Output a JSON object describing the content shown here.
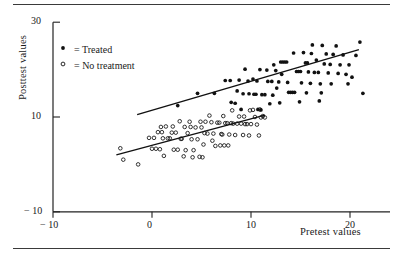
{
  "figure": {
    "rules": [
      "top-rule",
      "bottom-rule"
    ]
  },
  "chart_data": {
    "type": "scatter",
    "title": "",
    "xlabel": "Pretest values",
    "ylabel": "Posttest values",
    "xlim": [
      -14,
      24
    ],
    "ylim": [
      -10,
      32
    ],
    "xticks": [
      -10,
      0,
      10,
      20
    ],
    "xtick_labels": [
      "− 10",
      "0",
      "10",
      "20"
    ],
    "yticks": [
      -10,
      10,
      30
    ],
    "ytick_labels": [
      "− 10",
      "10",
      "30"
    ],
    "grid": false,
    "legend_position": "upper-left-inside",
    "legend": [
      {
        "marker": "filled-circle",
        "label": "= Treated"
      },
      {
        "marker": "open-circle",
        "label": "= No treatment"
      }
    ],
    "series": [
      {
        "name": "Treated",
        "marker": "filled-circle",
        "color": "#111111",
        "points": [
          [
            2.6,
            12.4
          ],
          [
            4.6,
            15.0
          ],
          [
            6.3,
            15.0
          ],
          [
            7.4,
            17.7
          ],
          [
            7.9,
            17.7
          ],
          [
            8.0,
            13.1
          ],
          [
            8.4,
            12.9
          ],
          [
            8.6,
            15.5
          ],
          [
            9.0,
            11.6
          ],
          [
            9.2,
            14.9
          ],
          [
            9.7,
            17.6
          ],
          [
            9.8,
            14.9
          ],
          [
            10.2,
            18.0
          ],
          [
            10.3,
            14.8
          ],
          [
            10.5,
            14.8
          ],
          [
            10.7,
            11.6
          ],
          [
            11.0,
            11.5
          ],
          [
            11.1,
            14.7
          ],
          [
            11.4,
            14.7
          ],
          [
            11.6,
            19.9
          ],
          [
            11.7,
            17.5
          ],
          [
            11.9,
            12.8
          ],
          [
            12.1,
            17.5
          ],
          [
            12.2,
            14.6
          ],
          [
            12.5,
            19.8
          ],
          [
            12.6,
            16.1
          ],
          [
            12.8,
            17.4
          ],
          [
            13.0,
            21.6
          ],
          [
            13.2,
            21.6
          ],
          [
            13.4,
            21.6
          ],
          [
            13.6,
            21.6
          ],
          [
            13.7,
            17.3
          ],
          [
            13.8,
            15.2
          ],
          [
            14.0,
            15.2
          ],
          [
            14.2,
            15.2
          ],
          [
            14.4,
            15.2
          ],
          [
            14.6,
            19.6
          ],
          [
            14.8,
            19.6
          ],
          [
            15.0,
            19.6
          ],
          [
            15.1,
            17.2
          ],
          [
            15.3,
            23.6
          ],
          [
            15.5,
            21.4
          ],
          [
            15.7,
            21.4
          ],
          [
            15.8,
            19.5
          ],
          [
            16.0,
            17.1
          ],
          [
            16.2,
            25.2
          ],
          [
            16.4,
            19.4
          ],
          [
            16.6,
            22.0
          ],
          [
            16.8,
            19.4
          ],
          [
            17.0,
            17.0
          ],
          [
            17.2,
            25.1
          ],
          [
            17.4,
            21.2
          ],
          [
            17.6,
            23.3
          ],
          [
            17.8,
            19.3
          ],
          [
            18.0,
            21.1
          ],
          [
            18.3,
            23.2
          ],
          [
            18.6,
            25.0
          ],
          [
            18.8,
            19.2
          ],
          [
            19.0,
            21.0
          ],
          [
            19.3,
            23.1
          ],
          [
            19.6,
            19.0
          ],
          [
            19.9,
            21.0
          ],
          [
            20.2,
            18.4
          ],
          [
            20.6,
            23.0
          ],
          [
            21.0,
            25.8
          ],
          [
            21.3,
            15.0
          ],
          [
            10.9,
            20.0
          ],
          [
            12.9,
            13.0
          ],
          [
            14.9,
            13.2
          ],
          [
            16.9,
            13.4
          ],
          [
            9.4,
            20.1
          ],
          [
            13.1,
            19.0
          ],
          [
            15.6,
            15.1
          ],
          [
            17.1,
            15.1
          ],
          [
            12.3,
            21.0
          ],
          [
            8.8,
            17.8
          ],
          [
            10.6,
            17.6
          ],
          [
            18.1,
            17.0
          ],
          [
            19.8,
            17.0
          ],
          [
            14.3,
            23.5
          ],
          [
            16.1,
            23.4
          ]
        ]
      },
      {
        "name": "No treatment",
        "marker": "open-circle",
        "color": "#111111",
        "points": [
          [
            -3.2,
            3.4
          ],
          [
            -2.9,
            1.0
          ],
          [
            -1.4,
            0.0
          ],
          [
            -0.3,
            5.6
          ],
          [
            0.0,
            3.3
          ],
          [
            0.2,
            5.6
          ],
          [
            0.4,
            3.3
          ],
          [
            0.6,
            6.8
          ],
          [
            0.8,
            3.2
          ],
          [
            1.0,
            6.8
          ],
          [
            1.2,
            1.8
          ],
          [
            1.4,
            8.0
          ],
          [
            1.6,
            5.5
          ],
          [
            1.8,
            5.5
          ],
          [
            2.0,
            6.7
          ],
          [
            2.2,
            3.1
          ],
          [
            2.4,
            6.7
          ],
          [
            2.6,
            3.1
          ],
          [
            2.8,
            9.1
          ],
          [
            3.0,
            5.4
          ],
          [
            3.2,
            1.7
          ],
          [
            3.4,
            3.0
          ],
          [
            3.6,
            6.6
          ],
          [
            3.8,
            9.0
          ],
          [
            4.0,
            5.3
          ],
          [
            4.2,
            3.0
          ],
          [
            4.4,
            7.8
          ],
          [
            4.6,
            5.3
          ],
          [
            4.8,
            1.6
          ],
          [
            5.0,
            7.8
          ],
          [
            5.2,
            4.2
          ],
          [
            5.4,
            9.0
          ],
          [
            5.6,
            6.5
          ],
          [
            5.8,
            10.3
          ],
          [
            6.0,
            8.9
          ],
          [
            6.2,
            6.5
          ],
          [
            6.4,
            3.9
          ],
          [
            6.6,
            8.8
          ],
          [
            6.8,
            8.8
          ],
          [
            7.0,
            6.4
          ],
          [
            7.2,
            10.2
          ],
          [
            7.4,
            8.7
          ],
          [
            7.6,
            8.7
          ],
          [
            7.8,
            6.3
          ],
          [
            8.0,
            8.7
          ],
          [
            8.2,
            8.6
          ],
          [
            8.4,
            6.2
          ],
          [
            8.6,
            8.6
          ],
          [
            8.8,
            10.1
          ],
          [
            9.0,
            8.6
          ],
          [
            9.2,
            6.2
          ],
          [
            9.4,
            8.5
          ],
          [
            9.6,
            8.5
          ],
          [
            9.8,
            6.1
          ],
          [
            10.0,
            8.5
          ],
          [
            10.2,
            11.5
          ],
          [
            10.4,
            10.0
          ],
          [
            10.6,
            8.4
          ],
          [
            10.8,
            6.1
          ],
          [
            11.0,
            9.9
          ],
          [
            11.2,
            10.2
          ],
          [
            11.4,
            9.9
          ],
          [
            3.9,
            7.9
          ],
          [
            2.1,
            8.0
          ],
          [
            1.1,
            5.5
          ],
          [
            0.9,
            7.9
          ],
          [
            6.1,
            5.0
          ],
          [
            7.1,
            6.3
          ],
          [
            4.1,
            1.5
          ],
          [
            5.1,
            1.5
          ],
          [
            2.9,
            5.4
          ],
          [
            8.1,
            11.4
          ],
          [
            9.9,
            11.4
          ],
          [
            6.9,
            4.0
          ],
          [
            7.3,
            4.0
          ],
          [
            7.7,
            4.0
          ],
          [
            5.3,
            6.6
          ],
          [
            3.3,
            7.9
          ],
          [
            4.9,
            9.0
          ],
          [
            9.3,
            10.1
          ],
          [
            10.9,
            11.6
          ]
        ]
      }
    ],
    "fit_lines": [
      {
        "name": "Treated fit",
        "x_start": -1.5,
        "y_start": 10.5,
        "x_end": 20.9,
        "y_end": 24.2
      },
      {
        "name": "No treatment fit",
        "x_start": -3.6,
        "y_start": 2.0,
        "x_end": 11.4,
        "y_end": 10.4
      }
    ]
  }
}
